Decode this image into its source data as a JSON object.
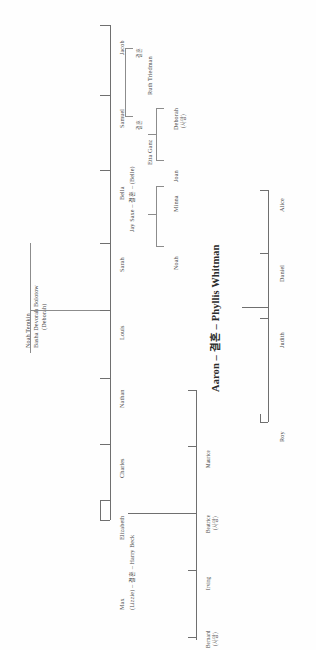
{
  "chart_title": "Temkin family tree",
  "orientation": "rotated-90-counterclockwise",
  "symbols": {
    "married": "결혼",
    "deceased": "(사망)"
  },
  "colors": {
    "line": "#8c8c8c",
    "text": "#4a4a4a",
    "heading": "#2b2b2b"
  },
  "generation1": {
    "father": "Noah Temkin",
    "mother_line1": "Basha Devorah Bolotow",
    "mother_line2": "(Deborah)"
  },
  "generation2": [
    {
      "name": "Max"
    },
    {
      "name": "Elizabeth",
      "spouse_line": "(Lizzie) – 결혼 – Harry Beck"
    },
    {
      "name": "Charles"
    },
    {
      "name": "Nathan"
    },
    {
      "name": "Louis"
    },
    {
      "name": "Sarah"
    },
    {
      "name": "Bella",
      "spouse_line": "Jay Saxe – 결혼 – (Belle)"
    },
    {
      "name": "Samuel",
      "marriage_mark": "결혼",
      "spouse": "Ruth Triedman"
    },
    {
      "name": "Jacob"
    }
  ],
  "samuel_first_marriage": {
    "mark": "결혼",
    "spouse": "Etta Ganz"
  },
  "bella_children": [
    "Noah",
    "Minna",
    "Joan"
  ],
  "samuel_children": [
    {
      "name_line1": "Deborah",
      "name_line2": "(사망)"
    }
  ],
  "generation3_beck": [
    {
      "name": "Bernard",
      "status": "(사망)"
    },
    {
      "name": "Irving",
      "status": ""
    },
    {
      "name": "Beatrice",
      "status": "(사망)"
    },
    {
      "name": "Maurice",
      "status": ""
    },
    {
      "name": "Aaron",
      "headline": "Aaron – 결혼 – Phyllis Whitman"
    }
  ],
  "aaron_children": [
    "Roy",
    "Judith",
    "Daniel",
    "Alice"
  ]
}
